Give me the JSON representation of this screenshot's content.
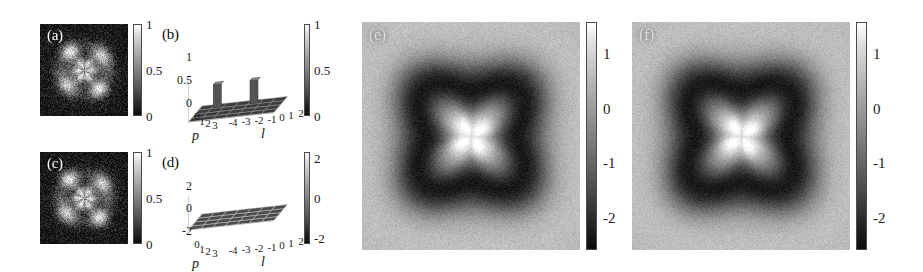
{
  "figure": {
    "panels": [
      "a",
      "b",
      "c",
      "d",
      "e",
      "f"
    ]
  },
  "panel_a": {
    "letter": "(a)",
    "kind": "intensity-image",
    "colorbar": {
      "ticks": [
        "1",
        "0.5",
        "0"
      ],
      "values": [
        1,
        0.5,
        0
      ],
      "vmin": 0,
      "vmax": 1
    }
  },
  "panel_b": {
    "letter": "(b)",
    "kind": "3d-bar",
    "xlabel": "l",
    "ylabel": "p",
    "z_ticks": [
      "1",
      "0.5",
      "0"
    ],
    "z_values": [
      1,
      0.5,
      0
    ],
    "l_ticks": [
      "-4",
      "-3",
      "-2",
      "-1",
      "0",
      "1",
      "2"
    ],
    "p_ticks": [
      "0",
      "1",
      "2",
      "3"
    ],
    "colorbar": {
      "ticks": [
        "1",
        "0.5",
        "0"
      ],
      "values": [
        1,
        0.5,
        0
      ],
      "vmin": 0,
      "vmax": 1
    }
  },
  "panel_c": {
    "letter": "(c)",
    "kind": "intensity-image",
    "colorbar": {
      "ticks": [
        "1",
        "0.5",
        "0"
      ],
      "values": [
        1,
        0.5,
        0
      ],
      "vmin": 0,
      "vmax": 1
    }
  },
  "panel_d": {
    "letter": "(d)",
    "kind": "3d-bar",
    "xlabel": "l",
    "ylabel": "p",
    "z_ticks": [
      "2",
      "0",
      "-2"
    ],
    "z_values": [
      2,
      0,
      -2
    ],
    "l_ticks": [
      "-4",
      "-3",
      "-2",
      "-1",
      "0",
      "1",
      "2"
    ],
    "p_ticks": [
      "0",
      "1",
      "2",
      "3"
    ],
    "colorbar": {
      "ticks": [
        "2",
        "0",
        "-2"
      ],
      "values": [
        2,
        0,
        -2
      ],
      "vmin": -3,
      "vmax": 3
    }
  },
  "panel_e": {
    "letter": "(e)",
    "kind": "wigner-image",
    "colorbar": {
      "ticks": [
        "1",
        "0",
        "-1",
        "-2"
      ],
      "values": [
        1,
        0,
        -1,
        -2
      ],
      "vmin": -2.6,
      "vmax": 1.5
    }
  },
  "panel_f": {
    "letter": "(f)",
    "kind": "wigner-image",
    "colorbar": {
      "ticks": [
        "1",
        "0",
        "-1",
        "-2"
      ],
      "values": [
        1,
        0,
        -1,
        -2
      ],
      "vmin": -2.6,
      "vmax": 1.5
    }
  },
  "chart_data": {
    "type": "bar",
    "title": "",
    "panels": [
      {
        "id": "b",
        "type": "bar",
        "title": "Density matrix amplitude",
        "xlabel": "l",
        "ylabel": "p",
        "zlabel": "",
        "x": [
          -4,
          -3,
          -2,
          -1,
          0,
          1,
          2
        ],
        "y": [
          0,
          1,
          2,
          3
        ],
        "zlim": [
          0,
          1
        ],
        "grid": true,
        "bars": [
          {
            "l": -3,
            "p": 0,
            "value": 0.5
          },
          {
            "l": 0,
            "p": 0,
            "value": 0.5
          }
        ],
        "note": "All other l,p cells are approximately zero."
      },
      {
        "id": "d",
        "type": "bar",
        "title": "Density matrix phase",
        "xlabel": "l",
        "ylabel": "p",
        "zlabel": "",
        "x": [
          -4,
          -3,
          -2,
          -1,
          0,
          1,
          2
        ],
        "y": [
          0,
          1,
          2,
          3
        ],
        "zlim": [
          -3,
          3
        ],
        "grid": true,
        "bars": [],
        "note": "Phase surface is flat at approximately zero across all l,p cells."
      },
      {
        "id": "e",
        "type": "heatmap",
        "title": "Wigner function (measured)",
        "xlabel": "",
        "ylabel": "",
        "clim": [
          -2.6,
          1.5
        ],
        "colorbar_ticks": [
          1,
          0,
          -1,
          -2
        ],
        "grid": false
      },
      {
        "id": "f",
        "type": "heatmap",
        "title": "Wigner function (theory)",
        "xlabel": "",
        "ylabel": "",
        "clim": [
          -2.6,
          1.5
        ],
        "colorbar_ticks": [
          1,
          0,
          -1,
          -2
        ],
        "grid": false
      }
    ]
  }
}
